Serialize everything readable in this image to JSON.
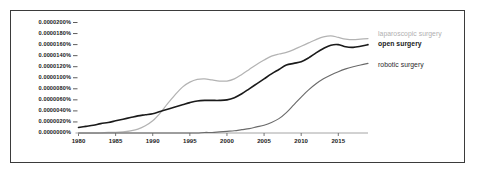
{
  "chart_data": {
    "type": "line",
    "title": "",
    "subtitle": "",
    "xlabel": "",
    "ylabel": "",
    "xlim": [
      1980,
      2019
    ],
    "ylim": [
      0.0,
      2e-05
    ],
    "grid": false,
    "legend_position": "right-inline",
    "x_tick_labels": [
      "1980",
      "1985",
      "1990",
      "1995",
      "2000",
      "2005",
      "2010",
      "2015"
    ],
    "x_ticks": [
      1980,
      1985,
      1990,
      1995,
      2000,
      2005,
      2010,
      2015
    ],
    "y_tick_labels": [
      "0.0000000%",
      "0.0000020%",
      "0.0000040%",
      "0.0000060%",
      "0.0000080%",
      "0.0000100%",
      "0.0000120%",
      "0.0000140%",
      "0.0000160%",
      "0.0000180%",
      "0.0000200%"
    ],
    "y_ticks": [
      0.0,
      2e-06,
      4e-06,
      6e-06,
      8e-06,
      1e-05,
      1.2e-05,
      1.4e-05,
      1.6e-05,
      1.8e-05,
      2e-05
    ],
    "x": [
      1980,
      1981,
      1982,
      1983,
      1984,
      1985,
      1986,
      1987,
      1988,
      1989,
      1990,
      1991,
      1992,
      1993,
      1994,
      1995,
      1996,
      1997,
      1998,
      1999,
      2000,
      2001,
      2002,
      2003,
      2004,
      2005,
      2006,
      2007,
      2008,
      2009,
      2010,
      2011,
      2012,
      2013,
      2014,
      2015,
      2016,
      2017,
      2018,
      2019
    ],
    "series": [
      {
        "name": "laparoscopic surgery",
        "color": "#b3b3b3",
        "label_color": "#b0b0b0",
        "values": [
          0.0,
          0.0,
          0.0,
          0.0,
          1e-07,
          1e-07,
          2e-07,
          4e-07,
          7e-07,
          1.3e-06,
          2.2e-06,
          3.6e-06,
          5.3e-06,
          6.9e-06,
          8.3e-06,
          9.2e-06,
          9.7e-06,
          9.8e-06,
          9.6e-06,
          9.4e-06,
          9.4e-06,
          9.8e-06,
          1.06e-05,
          1.15e-05,
          1.24e-05,
          1.32e-05,
          1.39e-05,
          1.43e-05,
          1.46e-05,
          1.51e-05,
          1.57e-05,
          1.63e-05,
          1.69e-05,
          1.74e-05,
          1.76e-05,
          1.73e-05,
          1.7e-05,
          1.69e-05,
          1.7e-05,
          1.71e-05
        ]
      },
      {
        "name": "open surgery",
        "color": "#1a1a1a",
        "label_color": "#1a1a1a",
        "values": [
          1e-06,
          1.2e-06,
          1.4e-06,
          1.7e-06,
          1.9e-06,
          2.2e-06,
          2.5e-06,
          2.8e-06,
          3.1e-06,
          3.3e-06,
          3.5e-06,
          3.9e-06,
          4.3e-06,
          4.7e-06,
          5.1e-06,
          5.5e-06,
          5.8e-06,
          5.9e-06,
          5.9e-06,
          5.9e-06,
          6e-06,
          6.4e-06,
          7.1e-06,
          8e-06,
          8.9e-06,
          9.8e-06,
          1.07e-05,
          1.15e-05,
          1.23e-05,
          1.26e-05,
          1.29e-05,
          1.36e-05,
          1.45e-05,
          1.53e-05,
          1.59e-05,
          1.6e-05,
          1.56e-05,
          1.55e-05,
          1.57e-05,
          1.6e-05
        ]
      },
      {
        "name": "robotic surgery",
        "color": "#6b6b6b",
        "label_color": "#2a2a2a",
        "values": [
          0.0,
          0.0,
          0.0,
          0.0,
          0.0,
          0.0,
          0.0,
          0.0,
          0.0,
          0.0,
          0.0,
          0.0,
          0.0,
          0.0,
          0.0,
          0.0,
          0.0,
          1e-07,
          1e-07,
          2e-07,
          3e-07,
          4e-07,
          6e-07,
          8e-07,
          1.1e-06,
          1.4e-06,
          1.9e-06,
          2.6e-06,
          3.7e-06,
          5.1e-06,
          6.5e-06,
          7.8e-06,
          8.9e-06,
          9.8e-06,
          1.05e-05,
          1.11e-05,
          1.16e-05,
          1.2e-05,
          1.23e-05,
          1.26e-05
        ]
      }
    ]
  },
  "labels": {
    "laparoscopic": "laparoscopic surgery",
    "open": "open surgery",
    "robotic": "robotic surgery"
  }
}
